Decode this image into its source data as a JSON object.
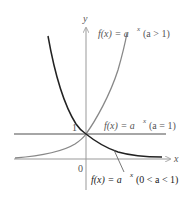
{
  "diagram": {
    "axes": {
      "x_label": "x",
      "y_label": "y",
      "origin_label": "0",
      "y_intercept_label": "1"
    },
    "curves": [
      {
        "id": "growth",
        "label_f": "f(x) = a",
        "label_exp": "x",
        "label_cond": "(a > 1)",
        "color": "#888888"
      },
      {
        "id": "constant",
        "label_f": "f(x) = a",
        "label_exp": "x",
        "label_cond": "(a = 1)",
        "color": "#888888"
      },
      {
        "id": "decay",
        "label_f": "f(x) = a",
        "label_exp": "x",
        "label_cond": "(0 < a < 1)",
        "color": "#222222"
      }
    ],
    "colors": {
      "axis": "#999999",
      "growth_curve": "#888888",
      "decay_curve": "#222222",
      "constant_line": "#888888"
    }
  }
}
